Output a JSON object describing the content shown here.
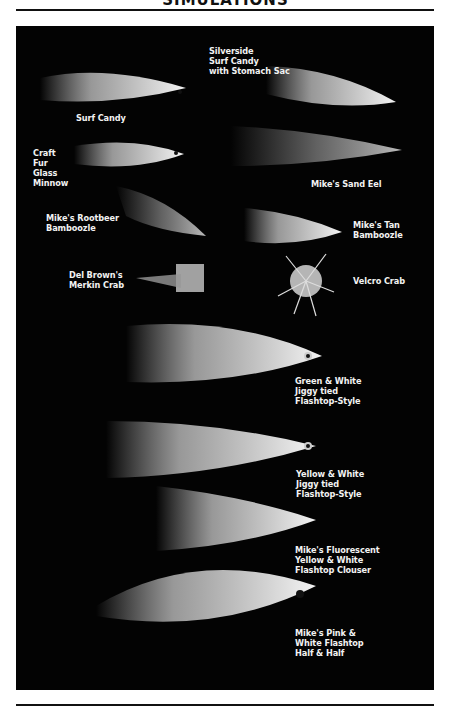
{
  "page": {
    "title": "SIMULATIONS"
  },
  "photo": {
    "background": "#030303",
    "labels": [
      {
        "id": "surf-candy",
        "text": "Surf Candy"
      },
      {
        "id": "silverside-surf-candy",
        "text": "Silverside\nSurf Candy\nwith Stomach Sac"
      },
      {
        "id": "craft-fur-glass-minnow",
        "text": "Craft\nFur\nGlass\nMinnow"
      },
      {
        "id": "mikes-sand-eel",
        "text": "Mike's Sand Eel"
      },
      {
        "id": "mikes-rootbeer-bamboozle",
        "text": "Mike's Rootbeer\nBamboozle"
      },
      {
        "id": "mikes-tan-bamboozle",
        "text": "Mike's Tan\nBamboozle"
      },
      {
        "id": "del-browns-merkin-crab",
        "text": "Del Brown's\nMerkin Crab"
      },
      {
        "id": "velcro-crab",
        "text": "Velcro Crab"
      },
      {
        "id": "green-white-jiggy",
        "text": "Green & White\nJiggy tied\nFlashtop-Style"
      },
      {
        "id": "yellow-white-jiggy",
        "text": "Yellow & White\nJiggy tied\nFlashtop-Style"
      },
      {
        "id": "fluorescent-yellow-white-clouser",
        "text": "Mike's Fluorescent\nYellow & White\nFlashtop Clouser"
      },
      {
        "id": "pink-white-half-and-half",
        "text": "Mike's Pink &\nWhite Flashtop\nHalf & Half"
      }
    ]
  }
}
